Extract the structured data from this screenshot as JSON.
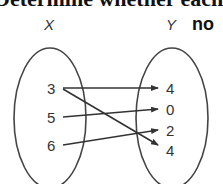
{
  "header": {
    "text": "Determine whether each"
  },
  "diagram": {
    "domain_label": "X",
    "range_label": "Y",
    "answer": "no",
    "domain": [
      "3",
      "5",
      "6"
    ],
    "range": [
      "4",
      "0",
      "2",
      "4"
    ],
    "mappings": [
      {
        "from": "3",
        "to_index": 0
      },
      {
        "from": "3",
        "to_index": 3
      },
      {
        "from": "5",
        "to_index": 1
      },
      {
        "from": "6",
        "to_index": 2
      }
    ],
    "colors": {
      "stroke": "#333333",
      "text": "#333333"
    }
  }
}
